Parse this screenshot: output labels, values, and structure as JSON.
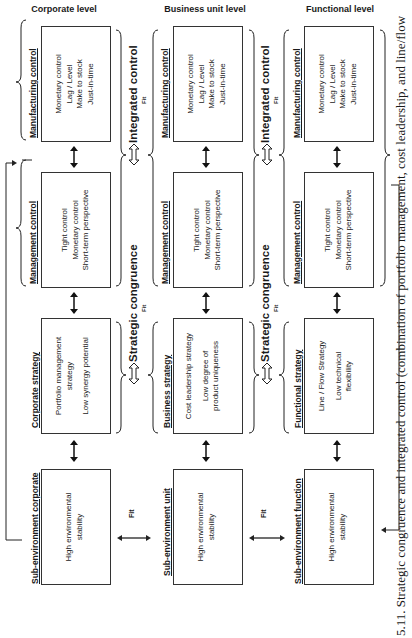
{
  "levels": [
    {
      "title": "Corporate level",
      "manufacturing": {
        "title": "Manufacturing control",
        "lines": [
          "Monetary control",
          "Lag / Level",
          "Make to stock",
          "Just-in-time"
        ]
      },
      "management": {
        "title": "Management control",
        "lines": [
          "Tight control",
          "Monetary control",
          "Short-term perspective"
        ]
      },
      "strategy": {
        "title": "Corporate strategy",
        "lines": [
          "Portfolio management",
          "strategy",
          "",
          "Low synergy potential"
        ]
      },
      "environment": {
        "title": "Sub-environment corporate",
        "lines": [
          "High environmental",
          "stability"
        ]
      }
    },
    {
      "title": "Business unit level",
      "manufacturing": {
        "title": "Manufacturing control",
        "lines": [
          "Monetary control",
          "Lag / Level",
          "Make to stock",
          "Just-in-time"
        ]
      },
      "management": {
        "title": "Management control",
        "lines": [
          "Tight control",
          "Monetary control",
          "Short-term perspective"
        ]
      },
      "strategy": {
        "title": "Business strategy",
        "lines": [
          "Cost leadership strategy",
          "",
          "Low degree of",
          "product uniqueness"
        ]
      },
      "environment": {
        "title": "Sub-environment unit",
        "lines": [
          "High environmental",
          "stability"
        ]
      }
    },
    {
      "title": "Functional level",
      "manufacturing": {
        "title": "Manufacturing control",
        "lines": [
          "Monetary control",
          "Lag / Level",
          "Make to stock",
          "Just-in-time"
        ]
      },
      "management": {
        "title": "Management control",
        "lines": [
          "Tight control",
          "Monetary control",
          "Short-term perspective"
        ]
      },
      "strategy": {
        "title": "Functional strategy",
        "lines": [
          "Line / Flow Strategy",
          "",
          "Low technical",
          "flexibility"
        ]
      },
      "environment": {
        "title": "Sub-environment function",
        "lines": [
          "High environmental",
          "stability"
        ]
      }
    }
  ],
  "connectors": {
    "integrated_control": "Integrated control",
    "strategic_congruence": "Strategic congruence",
    "fit": "Fit"
  },
  "caption": "5.11. Strategic congruence and integrated control (combination of portfolio management, cost leadership, and line/flow"
}
